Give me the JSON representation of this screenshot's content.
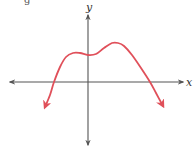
{
  "chart_data": {
    "type": "line",
    "title": "",
    "xlabel": "x",
    "ylabel": "y",
    "grid": false,
    "legend": null,
    "axes": {
      "x_axis": {
        "y_px": 82,
        "x_start_px": 10,
        "x_end_px": 183,
        "arrows": "both"
      },
      "y_axis": {
        "x_px": 88,
        "y_start_px": 15,
        "y_end_px": 145,
        "arrows": "both"
      }
    },
    "series": [
      {
        "name": "polynomial curve",
        "color": "#e0505a",
        "description": "Even-degree polynomial falling to -infinity at both ends; two real x-intercepts, a shoulder left of the y-axis, a slight local minimum at the y-intercept and a local maximum right of the y-axis",
        "end_behavior": {
          "left": "down",
          "right": "down"
        },
        "points_px": [
          [
            45,
            107
          ],
          [
            50,
            95
          ],
          [
            54,
            82
          ],
          [
            60,
            67
          ],
          [
            66,
            57
          ],
          [
            73,
            53
          ],
          [
            80,
            53
          ],
          [
            88,
            55
          ],
          [
            96,
            54
          ],
          [
            104,
            48
          ],
          [
            112,
            43
          ],
          [
            118,
            43
          ],
          [
            124,
            46
          ],
          [
            132,
            55
          ],
          [
            141,
            68
          ],
          [
            150,
            82
          ],
          [
            156,
            93
          ],
          [
            163,
            106
          ]
        ]
      }
    ]
  },
  "labels": {
    "x_axis": "x",
    "y_axis": "y",
    "top_fragment": "g"
  },
  "colors": {
    "curve": "#e0505a",
    "axes": "#555555",
    "background": "#ffffff"
  }
}
